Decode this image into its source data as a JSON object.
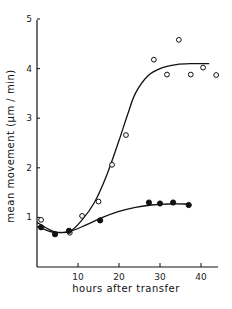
{
  "chart_data": {
    "type": "scatter",
    "title": "",
    "xlabel": "hours after transfer",
    "ylabel": "mean movement (μm / min)",
    "xlim": [
      0,
      44
    ],
    "ylim": [
      0,
      5
    ],
    "x_ticks": [
      10,
      20,
      30,
      40
    ],
    "x_tick_labels": [
      "10",
      "20",
      "30",
      "40"
    ],
    "y_ticks": [
      1,
      2,
      3,
      4,
      5
    ],
    "y_tick_labels": [
      "1",
      "2",
      "3",
      "4",
      "5"
    ],
    "grid": false,
    "legend": null,
    "series": [
      {
        "name": "open circles",
        "marker": "open-circle",
        "points": [
          {
            "x": 1,
            "y": 0.95
          },
          {
            "x": 8,
            "y": 0.69
          },
          {
            "x": 11,
            "y": 1.03
          },
          {
            "x": 15,
            "y": 1.32
          },
          {
            "x": 18.3,
            "y": 2.06
          },
          {
            "x": 21.7,
            "y": 2.66
          },
          {
            "x": 28.5,
            "y": 4.18
          },
          {
            "x": 31.7,
            "y": 3.88
          },
          {
            "x": 34.6,
            "y": 4.58
          },
          {
            "x": 37.5,
            "y": 3.88
          },
          {
            "x": 40.5,
            "y": 4.02
          },
          {
            "x": 43.7,
            "y": 3.87
          }
        ],
        "fit_curve": [
          [
            0,
            0.9
          ],
          [
            4,
            0.72
          ],
          [
            8,
            0.72
          ],
          [
            11,
            0.95
          ],
          [
            14,
            1.3
          ],
          [
            17,
            1.85
          ],
          [
            20,
            2.55
          ],
          [
            22,
            3.05
          ],
          [
            24,
            3.5
          ],
          [
            27,
            3.85
          ],
          [
            30,
            4.0
          ],
          [
            34,
            4.08
          ],
          [
            38,
            4.1
          ],
          [
            42,
            4.1
          ]
        ]
      },
      {
        "name": "filled circles",
        "marker": "filled-circle",
        "points": [
          {
            "x": 1,
            "y": 0.8
          },
          {
            "x": 4.4,
            "y": 0.66
          },
          {
            "x": 7.8,
            "y": 0.73
          },
          {
            "x": 15.4,
            "y": 0.94
          },
          {
            "x": 27.3,
            "y": 1.3
          },
          {
            "x": 30,
            "y": 1.28
          },
          {
            "x": 33.2,
            "y": 1.3
          },
          {
            "x": 37,
            "y": 1.25
          }
        ],
        "fit_curve": [
          [
            0,
            0.82
          ],
          [
            4,
            0.7
          ],
          [
            8,
            0.72
          ],
          [
            12,
            0.85
          ],
          [
            16,
            1.0
          ],
          [
            20,
            1.12
          ],
          [
            24,
            1.2
          ],
          [
            28,
            1.25
          ],
          [
            32,
            1.27
          ],
          [
            37,
            1.27
          ]
        ]
      }
    ]
  }
}
